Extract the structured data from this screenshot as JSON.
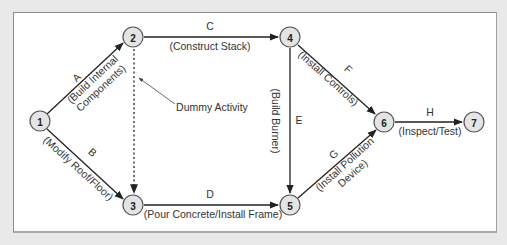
{
  "diagram": {
    "type": "activity-on-arrow network",
    "nodes": [
      {
        "id": "1",
        "label": "1"
      },
      {
        "id": "2",
        "label": "2"
      },
      {
        "id": "3",
        "label": "3"
      },
      {
        "id": "4",
        "label": "4"
      },
      {
        "id": "5",
        "label": "5"
      },
      {
        "id": "6",
        "label": "6"
      },
      {
        "id": "7",
        "label": "7"
      }
    ],
    "activities": [
      {
        "letter": "A",
        "description": "(Build Internal",
        "description2": "Components)",
        "from": "1",
        "to": "2"
      },
      {
        "letter": "B",
        "description": "(Modify Roof/Floor)",
        "from": "1",
        "to": "3"
      },
      {
        "letter": "C",
        "description": "(Construct Stack)",
        "from": "2",
        "to": "4"
      },
      {
        "letter": "D",
        "description": "(Pour Concrete/Install Frame)",
        "from": "3",
        "to": "5"
      },
      {
        "letter": "E",
        "description": "(Build Burner)",
        "from": "4",
        "to": "5"
      },
      {
        "letter": "F",
        "description": "(Install Controls)",
        "from": "4",
        "to": "6"
      },
      {
        "letter": "G",
        "description": "(Install Pollution",
        "description2": "Device)",
        "from": "5",
        "to": "6"
      },
      {
        "letter": "H",
        "description": "(Inspect/Test)",
        "from": "6",
        "to": "7"
      }
    ],
    "dummy": {
      "label": "Dummy Activity",
      "from": "2",
      "to": "3"
    }
  }
}
